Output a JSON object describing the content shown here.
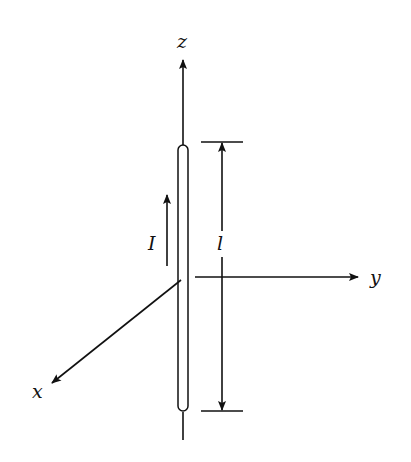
{
  "diagram": {
    "type": "dipole-antenna",
    "labels": {
      "z_axis": "z",
      "y_axis": "y",
      "x_axis": "x",
      "current": "I",
      "length": "l"
    },
    "colors": {
      "stroke": "#111111",
      "background": "#ffffff"
    }
  }
}
